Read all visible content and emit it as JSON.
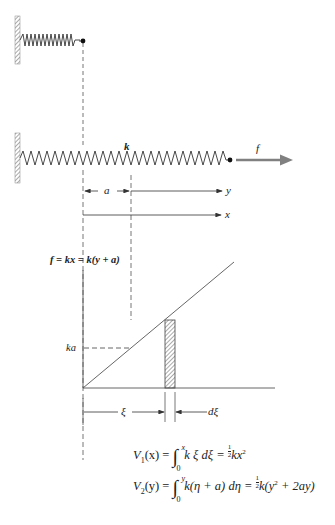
{
  "figure": {
    "top_spring": {
      "label": ""
    },
    "main_spring": {
      "label": "k"
    },
    "force_arrow": {
      "label": "f",
      "color": "#808080"
    },
    "dimension_a": {
      "label": "a"
    },
    "axis_y": {
      "label": "y"
    },
    "axis_x": {
      "label": "x"
    },
    "graph": {
      "line_label": "f = kx = k(y + a)",
      "ka_label": "ka",
      "xi_label": "ξ",
      "dxi_label": "dξ"
    },
    "equations": {
      "v1": {
        "lhs": "V",
        "lhs_sub": "1",
        "lhs_arg": "(x) =",
        "upper": "x",
        "lower": "0",
        "integrand": "k ξ dξ =",
        "frac_num": "1",
        "frac_den": "2",
        "rhs": "kx",
        "rhs_sup": "2"
      },
      "v2": {
        "lhs": "V",
        "lhs_sub": "2",
        "lhs_arg": "(y) =",
        "upper": "y",
        "lower": "0",
        "integrand": "k(η + a) dη =",
        "frac_num": "1",
        "frac_den": "2",
        "rhs_pre": "k(y",
        "rhs_sup": "2",
        "rhs_post": " + 2ay)"
      }
    }
  }
}
